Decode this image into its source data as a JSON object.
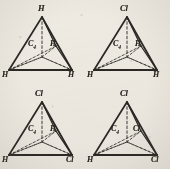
{
  "figure": {
    "ink_color": "#2a2724",
    "paper_color": "#efece5",
    "panel_count": 4
  },
  "panels": [
    {
      "id": "panel-1",
      "position": "top-left",
      "apex_label": "H",
      "center_label": "C",
      "center_subscript": "4",
      "inner_right_label": "H",
      "base_left_label": "H",
      "base_right_label": "H"
    },
    {
      "id": "panel-2",
      "position": "top-right",
      "apex_label": "Cl",
      "center_label": "C",
      "center_subscript": "4",
      "inner_right_label": "H",
      "base_left_label": "H",
      "base_right_label": "H"
    },
    {
      "id": "panel-3",
      "position": "bottom-left",
      "apex_label": "Cl",
      "center_label": "C",
      "center_subscript": "4",
      "inner_right_label": "H",
      "base_left_label": "H",
      "base_right_label": "Cl"
    },
    {
      "id": "panel-4",
      "position": "bottom-right",
      "apex_label": "Cl",
      "center_label": "C",
      "center_subscript": "4",
      "inner_right_label": "Cl",
      "base_left_label": "H",
      "base_right_label": "Cl"
    }
  ]
}
